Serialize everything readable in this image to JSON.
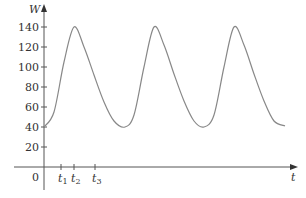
{
  "chart_data": {
    "type": "line",
    "title": "",
    "xlabel": "t",
    "ylabel": "W",
    "ylim": [
      0,
      150
    ],
    "yticks": [
      20,
      40,
      60,
      80,
      100,
      120,
      140
    ],
    "ytick_labels": [
      "20",
      "40",
      "60",
      "80",
      "100",
      "120",
      "140"
    ],
    "origin_label": "0",
    "xticks_labels": [
      {
        "name": "t",
        "sub": "1",
        "x": 17
      },
      {
        "name": "t",
        "sub": "2",
        "x": 30
      },
      {
        "name": "t",
        "sub": "3",
        "x": 51
      }
    ],
    "grid": false,
    "legend": null,
    "series": [
      {
        "name": "W(t)",
        "color": "#888888",
        "x": [
          0,
          10,
          20,
          30,
          40,
          50,
          60,
          70,
          81,
          90,
          100,
          110,
          120,
          130,
          140,
          150,
          160,
          170,
          180,
          190,
          200,
          210,
          220,
          230,
          241
        ],
        "values": [
          40,
          55,
          105,
          140,
          120,
          92,
          65,
          46,
          40,
          52,
          100,
          140,
          122,
          93,
          66,
          46,
          40,
          52,
          100,
          140,
          122,
          93,
          66,
          46,
          41
        ]
      }
    ]
  },
  "axes": {
    "y_title": "W",
    "x_title": "t",
    "origin": "0"
  },
  "colors": {
    "axis": "#555555",
    "curve": "#8a8a8a",
    "text": "#333333"
  }
}
